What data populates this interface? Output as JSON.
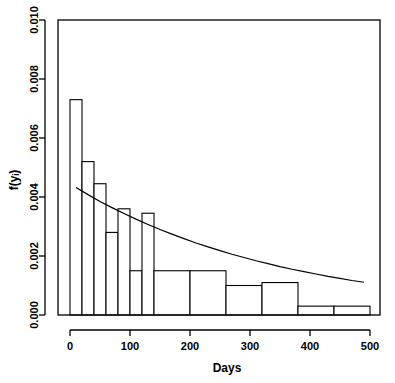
{
  "chart_data": {
    "type": "bar",
    "title": "",
    "subtitle": "",
    "xlabel": "Days",
    "ylabel": "f(yᵢ)",
    "xlim": [
      0,
      500
    ],
    "ylim": [
      0,
      0.01
    ],
    "grid": false,
    "legend": false,
    "x_ticks": [
      0,
      100,
      200,
      300,
      400,
      500
    ],
    "x_tick_labels": [
      "0",
      "100",
      "200",
      "300",
      "400",
      "500"
    ],
    "y_ticks": [
      0.0,
      0.002,
      0.004,
      0.006,
      0.008,
      0.01
    ],
    "y_tick_labels": [
      "0.000",
      "0.002",
      "0.004",
      "0.006",
      "0.008",
      "0.010"
    ],
    "bins": [
      {
        "x0": 0,
        "x1": 20,
        "density": 0.0073
      },
      {
        "x0": 20,
        "x1": 40,
        "density": 0.0052
      },
      {
        "x0": 40,
        "x1": 60,
        "density": 0.00445
      },
      {
        "x0": 60,
        "x1": 80,
        "density": 0.0028
      },
      {
        "x0": 80,
        "x1": 100,
        "density": 0.0036
      },
      {
        "x0": 100,
        "x1": 120,
        "density": 0.0015
      },
      {
        "x0": 120,
        "x1": 140,
        "density": 0.00345
      },
      {
        "x0": 140,
        "x1": 200,
        "density": 0.0015
      },
      {
        "x0": 200,
        "x1": 260,
        "density": 0.0015
      },
      {
        "x0": 260,
        "x1": 320,
        "density": 0.001
      },
      {
        "x0": 320,
        "x1": 380,
        "density": 0.0011
      },
      {
        "x0": 380,
        "x1": 440,
        "density": 0.0003
      },
      {
        "x0": 440,
        "x1": 500,
        "density": 0.0003
      }
    ],
    "series": [
      {
        "name": "fitted exponential density",
        "type": "line",
        "x": [
          10,
          30,
          50,
          70,
          90,
          110,
          130,
          150,
          170,
          190,
          210,
          230,
          250,
          270,
          290,
          310,
          330,
          350,
          370,
          390,
          410,
          430,
          450,
          470,
          490
        ],
        "y": [
          0.00432,
          0.00408,
          0.00385,
          0.00364,
          0.00344,
          0.00325,
          0.00307,
          0.0029,
          0.00274,
          0.00259,
          0.00244,
          0.00231,
          0.00218,
          0.00206,
          0.00195,
          0.00184,
          0.00174,
          0.00164,
          0.00155,
          0.00147,
          0.00139,
          0.00131,
          0.00124,
          0.00117,
          0.00111
        ]
      }
    ]
  },
  "colors": {
    "axis": "#000000",
    "bar_stroke": "#000000",
    "bar_fill": "#ffffff",
    "curve": "#000000",
    "background": "#ffffff"
  }
}
